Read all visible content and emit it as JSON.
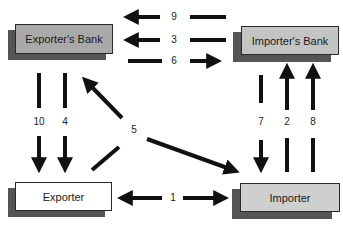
{
  "diagram": {
    "type": "flow",
    "nodes": [
      {
        "id": "exporters_bank",
        "label": "Exporter's Bank",
        "fill": "#a9a9a9"
      },
      {
        "id": "importers_bank",
        "label": "Importer's Bank",
        "fill": "#c4c4c4"
      },
      {
        "id": "exporter",
        "label": "Exporter",
        "fill": "#ffffff"
      },
      {
        "id": "importer",
        "label": "Importer",
        "fill": "#cfcfcf"
      }
    ],
    "edges": [
      {
        "step": "1",
        "from": "importer",
        "to": "exporter",
        "bidirectional": true
      },
      {
        "step": "2",
        "from": "importer",
        "to": "importers_bank"
      },
      {
        "step": "3",
        "from": "importers_bank",
        "to": "exporters_bank"
      },
      {
        "step": "4",
        "from": "exporters_bank",
        "to": "exporter"
      },
      {
        "step": "5",
        "from": "exporter",
        "to": "exporters_bank",
        "also_to": "importer"
      },
      {
        "step": "6",
        "from": "exporters_bank",
        "to": "importers_bank"
      },
      {
        "step": "7",
        "from": "importers_bank",
        "to": "importer"
      },
      {
        "step": "8",
        "from": "importer",
        "to": "importers_bank"
      },
      {
        "step": "9",
        "from": "importers_bank",
        "to": "exporters_bank"
      },
      {
        "step": "10",
        "from": "exporters_bank",
        "to": "exporter"
      }
    ]
  },
  "labels": {
    "n1": "1",
    "n2": "2",
    "n3": "3",
    "n4": "4",
    "n5": "5",
    "n6": "6",
    "n7": "7",
    "n8": "8",
    "n9": "9",
    "n10": "10"
  },
  "colors": {
    "arrow": "#111111",
    "shadow": "#555555",
    "border": "#2a2a2a"
  }
}
